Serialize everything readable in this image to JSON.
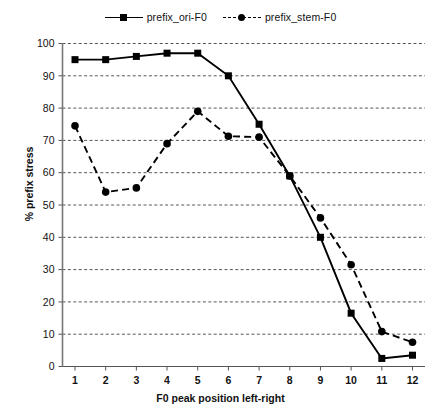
{
  "chart_data": {
    "type": "line",
    "title": "",
    "xlabel": "F0 peak position left-right",
    "ylabel": "% prefix stress",
    "x": [
      1,
      2,
      3,
      4,
      5,
      6,
      7,
      8,
      9,
      10,
      11,
      12
    ],
    "xticklabels": [
      "1",
      "2",
      "3",
      "4",
      "5",
      "6",
      "7",
      "8",
      "9",
      "10",
      "11",
      "12"
    ],
    "yticklabels": [
      "0",
      "10",
      "20",
      "30",
      "40",
      "50",
      "60",
      "70",
      "80",
      "90",
      "100"
    ],
    "yticks": [
      0,
      10,
      20,
      30,
      40,
      50,
      60,
      70,
      80,
      90,
      100
    ],
    "ylim": [
      0,
      100
    ],
    "xlim": [
      1,
      12
    ],
    "grid": "horizontal-dashed",
    "legend_position": "top-center",
    "series": [
      {
        "name": "prefix_ori-F0",
        "linestyle": "solid",
        "marker": "square",
        "color": "#000000",
        "values": [
          95,
          95,
          96,
          97,
          97,
          90,
          75,
          59,
          40,
          16.5,
          2.5,
          3.5
        ]
      },
      {
        "name": "prefix_stem-F0",
        "linestyle": "dashed",
        "marker": "circle",
        "color": "#000000",
        "values": [
          74.5,
          54,
          55.3,
          69,
          79,
          71.3,
          71,
          59,
          46,
          31.5,
          10.8,
          7.5
        ]
      }
    ]
  },
  "legend": {
    "entries": [
      {
        "label": "prefix_ori-F0"
      },
      {
        "label": "prefix_stem-F0"
      }
    ]
  },
  "axes": {
    "x_title": "F0 peak position left-right",
    "y_title": "% prefix stress"
  }
}
